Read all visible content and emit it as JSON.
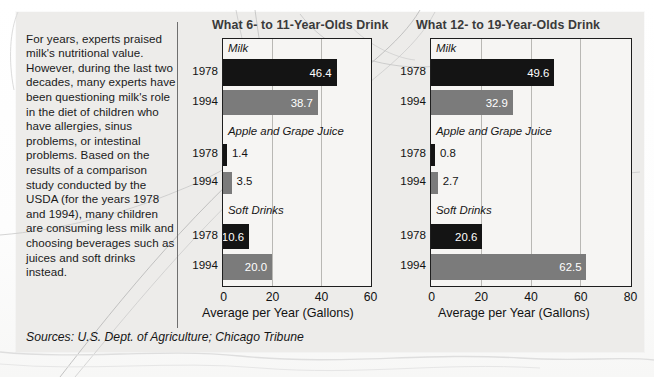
{
  "article": {
    "text": "For years, experts praised milk's nutritional value. However, during the last two decades, many experts have been questioning milk's role in the diet of children who have allergies, sinus problems, or intestinal problems. Based on the results of a comparison study conducted by the USDA (for the years 1978 and 1994), many children are consuming less milk and choosing beverages such as juices and soft drinks instead."
  },
  "sources": "Sources: U.S. Dept. of Agriculture; Chicago Tribune",
  "colors": {
    "bar_1978": "#141414",
    "bar_1994": "#7b7b7b",
    "plot_background": "#f6f5f3",
    "paper": "#edecea",
    "axis": "#1e1e1e",
    "gridline": "#b9b8b4",
    "title": "#3a3a3a"
  },
  "chart_data": [
    {
      "type": "bar",
      "title": "What 6- to 11-Year-Olds Drink",
      "xlabel": "Average per Year (Gallons)",
      "ylabel": "",
      "orientation": "horizontal",
      "xlim": [
        0,
        60
      ],
      "xticks": [
        "0",
        "20",
        "40",
        "60"
      ],
      "grid": true,
      "legend": "none",
      "groups": [
        {
          "name": "Milk",
          "bars": [
            {
              "year": "1978",
              "value": 46.4,
              "label": "46.4",
              "series": "1978",
              "label_inside": true
            },
            {
              "year": "1994",
              "value": 38.7,
              "label": "38.7",
              "series": "1994",
              "label_inside": true
            }
          ]
        },
        {
          "name": "Apple and Grape Juice",
          "bars": [
            {
              "year": "1978",
              "value": 1.4,
              "label": "1.4",
              "series": "1978",
              "label_inside": false
            },
            {
              "year": "1994",
              "value": 3.5,
              "label": "3.5",
              "series": "1994",
              "label_inside": false
            }
          ]
        },
        {
          "name": "Soft Drinks",
          "bars": [
            {
              "year": "1978",
              "value": 10.6,
              "label": "10.6",
              "series": "1978",
              "label_inside": true
            },
            {
              "year": "1994",
              "value": 20.0,
              "label": "20.0",
              "series": "1994",
              "label_inside": true
            }
          ]
        }
      ]
    },
    {
      "type": "bar",
      "title": "What 12- to 19-Year-Olds Drink",
      "xlabel": "Average per Year (Gallons)",
      "ylabel": "",
      "orientation": "horizontal",
      "xlim": [
        0,
        80
      ],
      "xticks": [
        "0",
        "20",
        "40",
        "60",
        "80"
      ],
      "grid": true,
      "legend": "none",
      "groups": [
        {
          "name": "Milk",
          "bars": [
            {
              "year": "1978",
              "value": 49.6,
              "label": "49.6",
              "series": "1978",
              "label_inside": true
            },
            {
              "year": "1994",
              "value": 32.9,
              "label": "32.9",
              "series": "1994",
              "label_inside": true
            }
          ]
        },
        {
          "name": "Apple and Grape Juice",
          "bars": [
            {
              "year": "1978",
              "value": 0.8,
              "label": "0.8",
              "series": "1978",
              "label_inside": false
            },
            {
              "year": "1994",
              "value": 2.7,
              "label": "2.7",
              "series": "1994",
              "label_inside": false
            }
          ]
        },
        {
          "name": "Soft Drinks",
          "bars": [
            {
              "year": "1978",
              "value": 20.6,
              "label": "20.6",
              "series": "1978",
              "label_inside": true
            },
            {
              "year": "1994",
              "value": 62.5,
              "label": "62.5",
              "series": "1994",
              "label_inside": true
            }
          ]
        }
      ]
    }
  ]
}
